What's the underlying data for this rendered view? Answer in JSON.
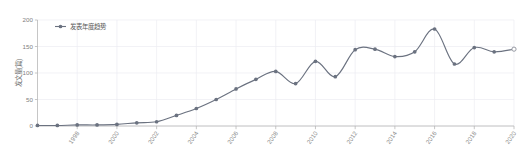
{
  "chart_data": {
    "type": "line",
    "title": "",
    "subtitle": "",
    "xlabel": "",
    "ylabel": "发文量(篇)",
    "ylim": [
      0,
      200
    ],
    "xlim": [
      1996,
      2020
    ],
    "grid": true,
    "legend_position": "top-left",
    "legend": [
      "发表年度趋势"
    ],
    "x_tick_labels": [
      "1998",
      "2000",
      "2002",
      "2004",
      "2006",
      "2008",
      "2010",
      "2012",
      "2014",
      "2016",
      "2018",
      "2020"
    ],
    "x_tick_values": [
      1998,
      2000,
      2002,
      2004,
      2006,
      2008,
      2010,
      2012,
      2014,
      2016,
      2018,
      2020
    ],
    "y_tick_labels": [
      "0",
      "50",
      "100",
      "150",
      "200"
    ],
    "y_tick_values": [
      0,
      50,
      100,
      150,
      200
    ],
    "x": [
      1996,
      1997,
      1998,
      1999,
      2000,
      2001,
      2002,
      2003,
      2004,
      2005,
      2006,
      2007,
      2008,
      2009,
      2010,
      2011,
      2012,
      2013,
      2014,
      2015,
      2016,
      2017,
      2018,
      2019,
      2020
    ],
    "series": [
      {
        "name": "发表年度趋势",
        "values": [
          1,
          1,
          2,
          2,
          3,
          6,
          8,
          20,
          33,
          50,
          70,
          88,
          103,
          80,
          122,
          93,
          144,
          145,
          131,
          140,
          183,
          117,
          148,
          140,
          145
        ],
        "marker": "circle",
        "color": "#6b7280",
        "last_point_marker": "open-circle"
      }
    ],
    "annotations": []
  },
  "legend": {
    "items": [
      {
        "label": "发表年度趋势",
        "marker_name": "legend-marker-line"
      }
    ]
  },
  "axes": {
    "y_title": "发文量(篇)",
    "x_title": ""
  }
}
